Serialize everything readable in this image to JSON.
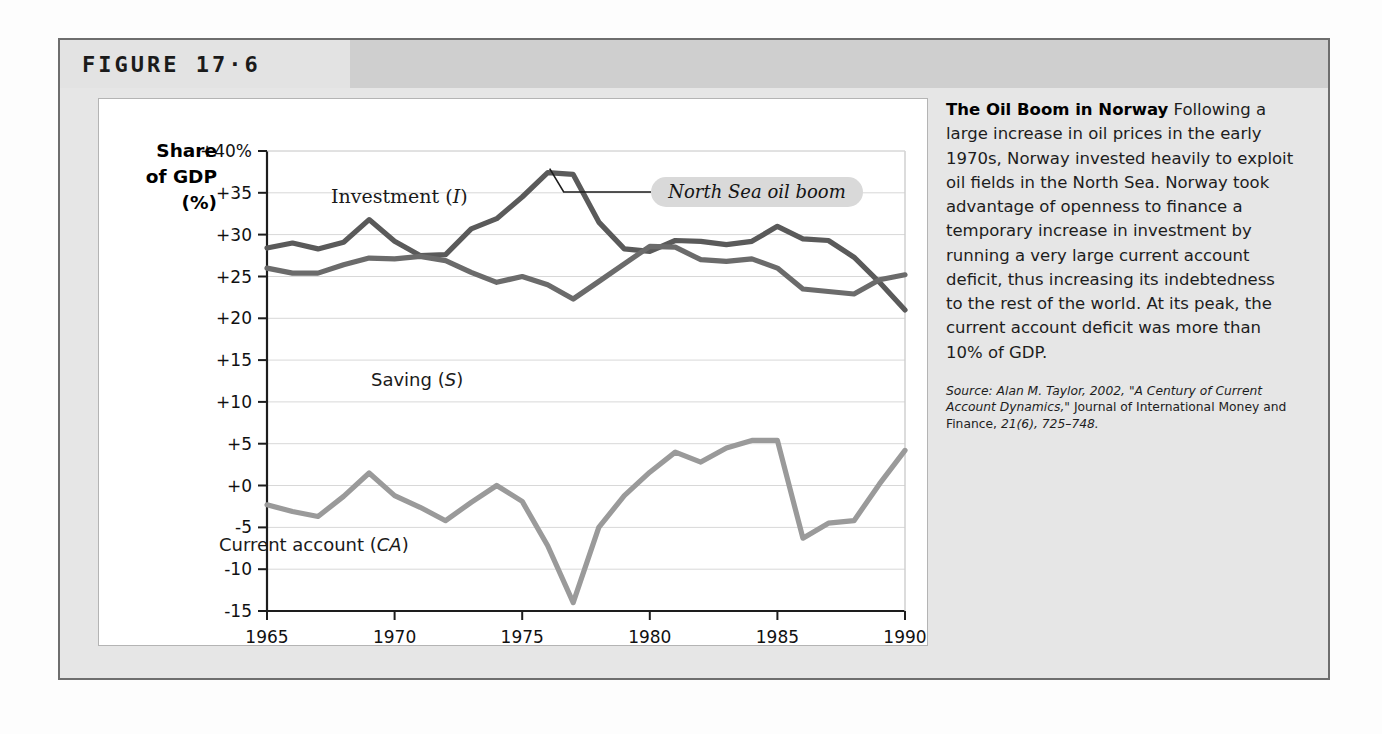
{
  "figure": {
    "number": "FIGURE 17·6"
  },
  "caption": {
    "title": "The Oil Boom in Norway",
    "body": " Following a large increase in oil prices in the early 1970s, Norway invested heavily to exploit oil fields in the North Sea. Norway took advantage of openness to finance a temporary increase in investment by running a very large current account deficit, thus increasing its indebtedness to the rest of the world. At its peak, the current account deficit was more than 10% of GDP.",
    "source_prefix": "Source: Alan M. Taylor, 2002, \"A Century of Current Account Dynamics,\"",
    "source_journal": " Journal of International Money and Finance, ",
    "source_cite": "21(6), 725–748."
  },
  "chart_data": {
    "type": "line",
    "title": "The Oil Boom in Norway",
    "xlabel": "",
    "ylabel": "Share of GDP (%)",
    "ylabel_lines": [
      "Share",
      "of GDP",
      "(%)"
    ],
    "xlim": [
      1965,
      1990
    ],
    "ylim": [
      -15,
      40
    ],
    "ytick_labels": [
      "+40%",
      "+35",
      "+30",
      "+25",
      "+20",
      "+15",
      "+10",
      "+5",
      "+0",
      "-5",
      "-10",
      "-15"
    ],
    "ytick_values": [
      40,
      35,
      30,
      25,
      20,
      15,
      10,
      5,
      0,
      -5,
      -10,
      -15
    ],
    "xtick_labels": [
      "1965",
      "1970",
      "1975",
      "1980",
      "1985",
      "1990"
    ],
    "xtick_values": [
      1965,
      1970,
      1975,
      1980,
      1985,
      1990
    ],
    "grid": true,
    "legend": "inline-labels",
    "annotations": [
      {
        "name": "north-sea-oil-boom",
        "text": "North Sea oil boom",
        "points_to_year": 1976
      }
    ],
    "x": [
      1965,
      1966,
      1967,
      1968,
      1969,
      1970,
      1971,
      1972,
      1973,
      1974,
      1975,
      1976,
      1977,
      1978,
      1979,
      1980,
      1981,
      1982,
      1983,
      1984,
      1985,
      1986,
      1987,
      1988,
      1989,
      1990
    ],
    "series": [
      {
        "name": "Investment (I)",
        "label": "Investment (",
        "label_italic": "I",
        "label_close": ")",
        "color": "#5a5a5a",
        "values": [
          28.4,
          29.0,
          28.3,
          29.1,
          31.8,
          29.2,
          27.5,
          27.6,
          30.7,
          31.9,
          34.5,
          37.4,
          37.2,
          31.5,
          28.3,
          28.0,
          29.3,
          29.2,
          28.8,
          29.2,
          31.0,
          29.5,
          29.3,
          27.3,
          24.3,
          21.0
        ]
      },
      {
        "name": "Saving (S)",
        "label": "Saving (",
        "label_italic": "S",
        "label_close": ")",
        "color": "#6b6b6b",
        "values": [
          26.0,
          25.4,
          25.4,
          26.4,
          27.2,
          27.1,
          27.4,
          26.9,
          25.5,
          24.3,
          25.0,
          24.0,
          22.3,
          24.4,
          26.5,
          28.6,
          28.5,
          27.0,
          26.8,
          27.1,
          26.0,
          23.5,
          23.2,
          22.9,
          24.6,
          25.2
        ]
      },
      {
        "name": "Current account (CA)",
        "label": "Current account (",
        "label_italic": "CA",
        "label_close": ")",
        "color": "#9a9a9a",
        "values": [
          -2.3,
          -3.1,
          -3.7,
          -1.3,
          1.5,
          -1.2,
          -2.6,
          -4.2,
          -2.0,
          0.0,
          -1.9,
          -7.2,
          -14.0,
          -5.0,
          -1.2,
          1.6,
          4.0,
          2.8,
          4.5,
          5.4,
          5.4,
          -6.3,
          -4.5,
          -4.2,
          0.2,
          4.2
        ]
      }
    ]
  }
}
